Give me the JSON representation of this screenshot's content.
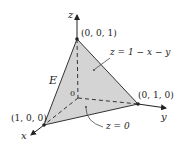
{
  "diagram": {
    "type": "3d-tetrahedron-region",
    "region_label": "E",
    "axes": {
      "x": "x",
      "y": "y",
      "z": "z",
      "origin": "0"
    },
    "vertices": [
      {
        "label": "(0, 0, 1)"
      },
      {
        "label": "(1, 0, 0)"
      },
      {
        "label": "(0, 1, 0)"
      }
    ],
    "surfaces": {
      "top": "z = 1 − x − y",
      "bottom": "z = 0"
    },
    "colors": {
      "fill": "#d4d4d4",
      "line": "#333333",
      "background": "#ffffff"
    }
  }
}
